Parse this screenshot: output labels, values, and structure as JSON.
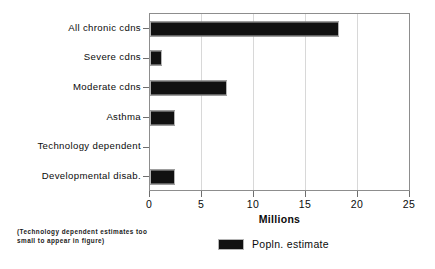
{
  "chart_data": {
    "type": "bar",
    "orientation": "horizontal",
    "title": "",
    "xlabel": "Millions",
    "ylabel": "",
    "xlim": [
      0,
      25
    ],
    "xticks": [
      0,
      5,
      10,
      15,
      20,
      25
    ],
    "grid": true,
    "legend_position": "bottom-center",
    "categories": [
      "All chronic cdns",
      "Severe cdns",
      "Moderate cdns",
      "Asthma",
      "Technology dependent",
      "Developmental disab."
    ],
    "series": [
      {
        "name": "Popln. estimate",
        "color": "#111111",
        "values": [
          18.2,
          1.2,
          7.4,
          2.4,
          0.0,
          2.4
        ]
      }
    ],
    "annotations": [
      "(Technology dependent estimates too small to appear in figure)"
    ]
  },
  "axis": {
    "x_title": "Millions",
    "tick_labels": [
      "0",
      "5",
      "10",
      "15",
      "20",
      "25"
    ]
  },
  "labels": {
    "c0": "All chronic cdns",
    "c1": "Severe cdns",
    "c2": "Moderate cdns",
    "c3": "Asthma",
    "c4": "Technology dependent",
    "c5": "Developmental disab."
  },
  "footnote": {
    "text": "(Technology dependent estimates too small to appear in figure)"
  },
  "legend": {
    "label": "Popln. estimate"
  }
}
